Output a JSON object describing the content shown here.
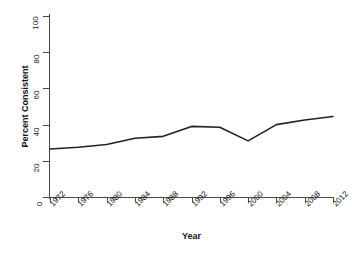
{
  "chart_data": {
    "type": "line",
    "title": "",
    "xlabel": "Year",
    "ylabel": "Percent Consistent",
    "xlim": [
      1972,
      2012
    ],
    "ylim": [
      0,
      100
    ],
    "grid": false,
    "legend": "none",
    "line_color": "#222222",
    "background_color": "#ffffff",
    "x_tick_labels": [
      "1972",
      "1976",
      "1980",
      "1984",
      "1988",
      "1992",
      "1996",
      "2000",
      "2004",
      "2008",
      "2012"
    ],
    "y_tick_labels": [
      "0",
      "20",
      "40",
      "60",
      "80",
      "100"
    ],
    "x": [
      1972,
      1976,
      1980,
      1984,
      1988,
      1992,
      1996,
      2000,
      2004,
      2008,
      2012
    ],
    "series": [
      {
        "name": "Percent Consistent",
        "values": [
          26.5,
          27.5,
          29.0,
          32.5,
          33.5,
          39.0,
          38.5,
          31.0,
          40.0,
          42.5,
          44.5
        ]
      }
    ]
  }
}
